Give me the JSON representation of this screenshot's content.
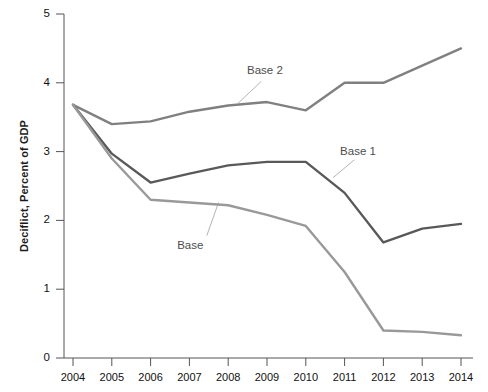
{
  "chart_data": {
    "type": "line",
    "title": "",
    "xlabel": "",
    "ylabel": "Deciflict, Percent of GDP",
    "x": [
      2004,
      2005,
      2006,
      2007,
      2008,
      2009,
      2010,
      2011,
      2012,
      2013,
      2014
    ],
    "xticklabels": [
      "2004",
      "2005",
      "2006",
      "2007",
      "2008",
      "2009",
      "2010",
      "2011",
      "2012",
      "2013",
      "2014"
    ],
    "yticklabels": [
      "0",
      "1",
      "2",
      "3",
      "4",
      "5"
    ],
    "yticks": [
      0,
      1,
      2,
      3,
      4,
      5
    ],
    "ylim": [
      0,
      5
    ],
    "xlim": [
      2004,
      2014
    ],
    "grid": false,
    "legend_position": "inline-annotations",
    "series": [
      {
        "name": "Base 2",
        "color": "#808080",
        "values": [
          3.68,
          3.4,
          3.44,
          3.58,
          3.67,
          3.72,
          3.6,
          4.0,
          4.0,
          4.25,
          4.5
        ]
      },
      {
        "name": "Base 1",
        "color": "#595959",
        "values": [
          3.68,
          2.97,
          2.55,
          2.68,
          2.8,
          2.85,
          2.85,
          2.4,
          1.68,
          1.88,
          1.95
        ]
      },
      {
        "name": "Base",
        "color": "#999999",
        "values": [
          3.68,
          2.9,
          2.3,
          2.26,
          2.22,
          2.08,
          1.92,
          1.25,
          0.4,
          0.38,
          0.33
        ]
      }
    ],
    "annotations": [
      {
        "text": "Base 2",
        "x": 2009,
        "y": 4.15
      },
      {
        "text": "Base 1",
        "x": 2011.4,
        "y": 2.98
      },
      {
        "text": "Base",
        "x": 2007.2,
        "y": 1.62
      }
    ]
  },
  "axis": {
    "y_label_text": "Deciflict, Percent of GDP"
  }
}
